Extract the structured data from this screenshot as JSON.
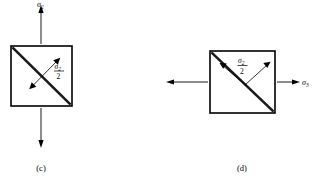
{
  "figure": {
    "background_color": "#ffffff",
    "line_color": "#000000",
    "diagonal_color": "#1a1a1a",
    "panels": [
      {
        "id": "c",
        "caption": "(c)",
        "loading": "vertical tension",
        "external_label": {
          "symbol": "σ",
          "subscript": "2",
          "position": "top"
        },
        "internal_label": {
          "numerator_symbol": "σ",
          "numerator_subscript": "2",
          "denominator": "2"
        },
        "square": {
          "x": 11,
          "y": 46,
          "width": 61,
          "height": 60
        },
        "arrows": {
          "up": {
            "from_y": 44,
            "to_y": 6
          },
          "down": {
            "from_y": 108,
            "to_y": 148
          }
        },
        "shear_arrow_direction": "perpendicular-to-diagonal"
      },
      {
        "id": "d",
        "caption": "(d)",
        "loading": "horizontal tension",
        "external_label": {
          "symbol": "σ",
          "subscript": "3",
          "position": "right"
        },
        "internal_label": {
          "numerator_symbol": "σ",
          "numerator_subscript": "2",
          "denominator": "2"
        },
        "square": {
          "x": 210,
          "y": 51,
          "width": 65,
          "height": 62
        },
        "arrows": {
          "left": {
            "from_x": 208,
            "to_x": 166
          },
          "right": {
            "from_x": 277,
            "to_x": 300
          }
        },
        "shear_arrow_direction": "perpendicular-to-diagonal"
      }
    ]
  }
}
